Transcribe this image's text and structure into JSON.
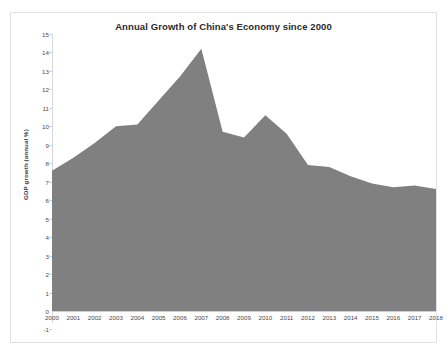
{
  "chart_data": {
    "type": "area",
    "title": "Annual Growth of China's Economy since 2000",
    "xlabel": "",
    "ylabel": "GDP growth (annual %)",
    "ylim": [
      -1,
      15
    ],
    "ytick_step": 1,
    "yticks": [
      15,
      14,
      13,
      12,
      11,
      10,
      9,
      8,
      7,
      6,
      5,
      4,
      3,
      2,
      1,
      0,
      -1
    ],
    "grid": false,
    "legend": "none",
    "fill_color": "#808080",
    "categories": [
      "2000",
      "2001",
      "2002",
      "2003",
      "2004",
      "2005",
      "2006",
      "2007",
      "2008",
      "2009",
      "2010",
      "2011",
      "2012",
      "2013",
      "2014",
      "2015",
      "2016",
      "2017",
      "2018"
    ],
    "values": [
      7.6,
      8.3,
      9.1,
      10.0,
      10.1,
      11.4,
      12.7,
      14.2,
      9.7,
      9.4,
      10.6,
      9.6,
      7.9,
      7.8,
      7.3,
      6.9,
      6.7,
      6.8,
      6.6
    ],
    "xlim_categories": [
      "2000",
      "2018"
    ]
  }
}
